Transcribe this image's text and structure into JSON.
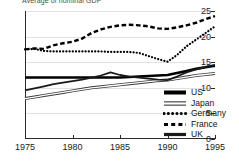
{
  "chart_data": {
    "type": "line",
    "title": "Average of nominal GDP",
    "xlabel": "",
    "ylabel": "",
    "x": [
      1975,
      1976,
      1977,
      1978,
      1979,
      1980,
      1981,
      1982,
      1983,
      1984,
      1985,
      1986,
      1987,
      1988,
      1989,
      1990,
      1991,
      1992,
      1993,
      1994,
      1995
    ],
    "xlim": [
      1975,
      1995
    ],
    "ylim": [
      0,
      25
    ],
    "xticks": [
      1975,
      1980,
      1985,
      1990,
      1995
    ],
    "yticks": [
      0,
      5,
      10,
      15,
      20,
      25
    ],
    "grid": true,
    "legend_position": "bottom-right",
    "series": [
      {
        "name": "US",
        "style": "solid-thick",
        "color": "#000000",
        "values": [
          12.0,
          12.0,
          12.0,
          12.0,
          12.0,
          12.0,
          12.0,
          12.0,
          12.0,
          12.0,
          12.0,
          12.1,
          12.2,
          12.3,
          12.4,
          12.5,
          12.9,
          13.3,
          13.7,
          14.0,
          14.3
        ]
      },
      {
        "name": "Japan",
        "style": "outlined-thin",
        "color": "#3a3a3a",
        "values": [
          7.9,
          8.2,
          8.5,
          8.8,
          9.1,
          9.4,
          9.7,
          10.0,
          10.2,
          10.4,
          10.6,
          10.8,
          11.0,
          11.2,
          11.4,
          11.5,
          11.8,
          12.1,
          12.4,
          12.6,
          12.8
        ]
      },
      {
        "name": "Germany",
        "style": "dotted",
        "color": "#000000",
        "values": [
          17.5,
          17.6,
          17.2,
          17.1,
          17.1,
          17.1,
          17.1,
          17.1,
          17.1,
          17.0,
          17.0,
          17.0,
          16.8,
          16.2,
          15.6,
          15.1,
          16.4,
          18.1,
          19.4,
          20.7,
          22.0
        ]
      },
      {
        "name": "France",
        "style": "dashed",
        "color": "#000000",
        "values": [
          17.5,
          17.7,
          17.6,
          18.3,
          18.7,
          19.0,
          19.6,
          20.7,
          21.4,
          21.9,
          22.2,
          22.3,
          22.2,
          22.0,
          21.6,
          21.5,
          21.8,
          22.2,
          22.7,
          23.4,
          24.0
        ]
      },
      {
        "name": "UK",
        "style": "solid-medium",
        "color": "#1a1a1a",
        "values": [
          9.5,
          9.9,
          10.3,
          10.7,
          11.0,
          11.3,
          11.6,
          12.0,
          12.4,
          13.0,
          12.5,
          12.2,
          12.0,
          11.8,
          11.6,
          11.5,
          12.2,
          13.0,
          13.6,
          14.1,
          14.5
        ]
      }
    ]
  }
}
